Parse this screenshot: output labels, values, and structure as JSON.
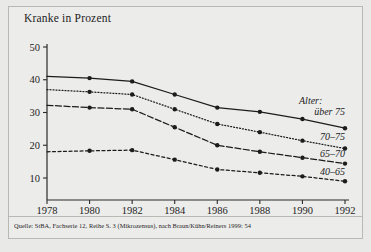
{
  "figure": {
    "title": "Kranke in Prozent",
    "caption": "Quelle: StBA, Fachserie 12, Reihe S. 3 (Mikrozensus), nach Braun/Kühn/Reiners 1999: 54",
    "legend_heading": "Alter:"
  },
  "chart_data": {
    "type": "line",
    "title": "Kranke in Prozent",
    "xlabel": "",
    "ylabel": "Kranke in Prozent",
    "x": [
      1978,
      1980,
      1982,
      1984,
      1986,
      1988,
      1990,
      1992
    ],
    "xtick_labels": [
      "1978",
      "1980",
      "1982",
      "1984",
      "1986",
      "1988",
      "1990",
      "1992"
    ],
    "ytick_labels": [
      "10",
      "20",
      "30",
      "40",
      "50"
    ],
    "yticks": [
      10,
      20,
      30,
      40,
      50
    ],
    "ylim": [
      5,
      50
    ],
    "xlim": [
      1978,
      1992
    ],
    "grid": false,
    "legend_position": "right-inline",
    "marker": "filled-circle",
    "series": [
      {
        "name": "über 75",
        "label": "über 75",
        "style": "solid",
        "color": "#1c1c1c",
        "values": [
          41.0,
          40.5,
          39.5,
          35.5,
          31.5,
          30.2,
          28.0,
          25.2
        ]
      },
      {
        "name": "70-75",
        "label": "70–75",
        "style": "dotted",
        "color": "#1c1c1c",
        "values": [
          37.0,
          36.3,
          35.5,
          31.0,
          26.5,
          24.0,
          21.4,
          19.0
        ]
      },
      {
        "name": "65-70",
        "label": "65–70",
        "style": "dashdot",
        "color": "#1c1c1c",
        "values": [
          32.2,
          31.5,
          31.0,
          25.5,
          20.0,
          18.0,
          16.2,
          14.4
        ]
      },
      {
        "name": "40-65",
        "label": "40–65",
        "style": "dashed",
        "color": "#1c1c1c",
        "values": [
          18.0,
          18.3,
          18.5,
          15.6,
          12.6,
          11.6,
          10.5,
          9.0
        ]
      }
    ]
  }
}
